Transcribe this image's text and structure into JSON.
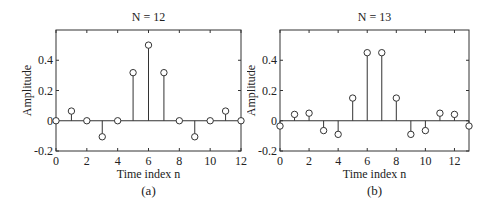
{
  "chart_data": [
    {
      "type": "stem",
      "title": "N = 12",
      "caption": "(a)",
      "xlabel": "Time index n",
      "ylabel": "Amplitude",
      "xlim": [
        0,
        12
      ],
      "ylim": [
        -0.2,
        0.6
      ],
      "xticks": [
        0,
        2,
        4,
        6,
        8,
        10,
        12
      ],
      "yticks": [
        -0.2,
        0,
        0.2,
        0.4
      ],
      "ytick_labels": [
        "-0.2",
        "0",
        "0.2",
        "0.4"
      ],
      "x": [
        0,
        1,
        2,
        3,
        4,
        5,
        6,
        7,
        8,
        9,
        10,
        11,
        12
      ],
      "values": [
        0,
        0.064,
        0,
        -0.106,
        0,
        0.318,
        0.5,
        0.318,
        0,
        -0.106,
        0,
        0.064,
        0
      ],
      "grid": false
    },
    {
      "type": "stem",
      "title": "N = 13",
      "caption": "(b)",
      "xlabel": "Time index n",
      "ylabel": "Amplitude",
      "xlim": [
        0,
        13
      ],
      "ylim": [
        -0.2,
        0.6
      ],
      "xticks": [
        0,
        2,
        4,
        6,
        8,
        10,
        12
      ],
      "yticks": [
        -0.2,
        0,
        0.2,
        0.4
      ],
      "ytick_labels": [
        "-0.2",
        "0",
        "0.2",
        "0.4"
      ],
      "x": [
        0,
        1,
        2,
        3,
        4,
        5,
        6,
        7,
        8,
        9,
        10,
        11,
        12,
        13
      ],
      "values": [
        -0.035,
        0.042,
        0.05,
        -0.065,
        -0.09,
        0.15,
        0.45,
        0.45,
        0.15,
        -0.09,
        -0.065,
        0.05,
        0.042,
        -0.035
      ],
      "grid": false
    }
  ]
}
